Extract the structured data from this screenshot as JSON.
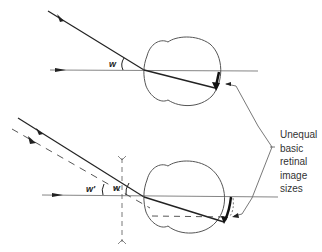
{
  "diagram": {
    "type": "optics diagram",
    "panels": [
      {
        "id": "top",
        "description": "Unaided eye: chief ray at angle w from axis passes through nodal point to retina",
        "angle_labels": [
          "w"
        ]
      },
      {
        "id": "bottom",
        "description": "Eye with correcting lens: dashed original ray and solid refracted ray subtend angles w' and w",
        "angle_labels": [
          "w'",
          "w"
        ]
      }
    ],
    "callout": {
      "lines": [
        "Unequal",
        "basic",
        "retinal",
        "image",
        "sizes"
      ]
    },
    "colors": {
      "line": "#222222",
      "eye_outline": "#555555",
      "axis": "#777777"
    }
  }
}
